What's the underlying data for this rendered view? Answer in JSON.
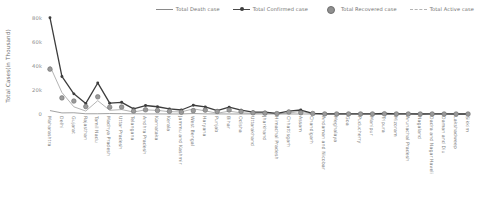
{
  "legend": {
    "items": [
      {
        "label": "Total Death case",
        "marker": "line",
        "color": "#8a8a8a"
      },
      {
        "label": "Total Confirmed case",
        "marker": "line-marker",
        "color": "#3d3d3d"
      },
      {
        "label": "Total Recovered case",
        "marker": "circle",
        "color": "#8f8f8f"
      },
      {
        "label": "Total Active case",
        "marker": "dashed-line",
        "color": "#b4b4b4"
      }
    ]
  },
  "chart_data": {
    "type": "line",
    "title": "",
    "xlabel": "",
    "ylabel": "Total Cases(in Thousand)",
    "ylim": [
      0,
      80000
    ],
    "yticks": [
      0,
      20000,
      40000,
      60000,
      80000
    ],
    "ytick_labels": [
      "0",
      "20k",
      "40k",
      "60k",
      "80k"
    ],
    "grid": false,
    "legend_position": "top-right",
    "categories": [
      "Maharashtra",
      "Delhi",
      "Gujarat",
      "Rajasthan",
      "Tamil Nadu",
      "Madhya Pradesh",
      "Uttar Pradesh",
      "Telangana",
      "Andhra Pradesh",
      "Karnataka",
      "Kerala",
      "Jammu and Kashmir",
      "West Bengal",
      "Haryana",
      "Punjab",
      "Bihar",
      "Odisha",
      "Uttarakhand",
      "Jharkhand",
      "Himachal Pradesh",
      "Chhattisgarh",
      "Assam",
      "Chandigarh",
      "Andaman and Nicobar",
      "Meghalaya",
      "Goa",
      "Puducherry",
      "Manipur",
      "Tripura",
      "Mizoram",
      "Arunachal Pradesh",
      "Nagaland",
      "Dadra and Nagar Haveli",
      "Daman and Diu",
      "Lakshadweep",
      "Sikkim"
    ],
    "series": [
      {
        "name": "Total Confirmed case",
        "color": "#3d3d3d",
        "values": [
          80229,
          31309,
          16794,
          8831,
          25872,
          8996,
          9733,
          4320,
          7071,
          6041,
          4189,
          3324,
          7303,
          5968,
          2805,
          5710,
          3140,
          1645,
          1530,
          525,
          2408,
          3319,
          452,
          104,
          44,
          70,
          158,
          97,
          422,
          117,
          76,
          11,
          55,
          33,
          1,
          1
        ]
      },
      {
        "name": "Total Recovered case",
        "color": "#8f8f8f",
        "values": [
          37390,
          13398,
          10780,
          6180,
          14316,
          5682,
          5804,
          2446,
          3494,
          2930,
          2220,
          1524,
          2776,
          3242,
          2104,
          3332,
          2128,
          1020,
          728,
          350,
          1640,
          1094,
          390,
          53,
          31,
          57,
          54,
          57,
          185,
          55,
          18,
          4,
          24,
          18,
          0,
          0
        ]
      },
      {
        "name": "Total Active case",
        "color": "#b4b4b4",
        "values": [
          39935,
          17915,
          5980,
          2460,
          11112,
          3074,
          3670,
          1692,
          3448,
          3008,
          1940,
          1762,
          4270,
          2620,
          634,
          2336,
          990,
          600,
          790,
          170,
          755,
          2217,
          58,
          51,
          13,
          13,
          104,
          40,
          235,
          62,
          57,
          7,
          30,
          15,
          1,
          1
        ]
      },
      {
        "name": "Total Death case",
        "color": "#8a8a8a",
        "values": [
          2849,
          905,
          1038,
          194,
          208,
          386,
          257,
          180,
          90,
          72,
          26,
          38,
          366,
          89,
          65,
          32,
          14,
          23,
          8,
          5,
          11,
          4,
          4,
          0,
          0,
          0,
          0,
          0,
          0,
          0,
          0,
          0,
          0,
          0,
          0,
          0
        ]
      }
    ]
  }
}
